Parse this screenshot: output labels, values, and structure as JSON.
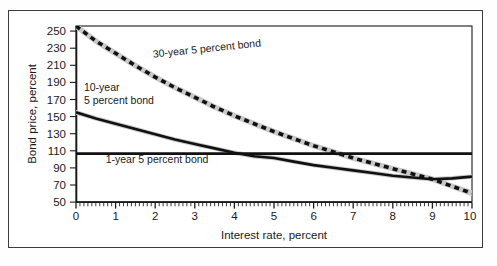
{
  "chart_data": {
    "type": "line",
    "title": "",
    "xlabel": "Interest rate, percent",
    "ylabel": "Bond price, percent",
    "xlim": [
      0,
      10
    ],
    "ylim": [
      50,
      250
    ],
    "xticks": [
      "0",
      "1",
      "2",
      "3",
      "4",
      "5",
      "6",
      "7",
      "8",
      "9",
      "10"
    ],
    "yticks": [
      "50",
      "70",
      "90",
      "110",
      "130",
      "150",
      "170",
      "190",
      "210",
      "230",
      "250"
    ],
    "grid": false,
    "legend_position": "inline-annotations",
    "x": [
      0,
      0.5,
      1,
      1.5,
      2,
      2.5,
      3,
      3.5,
      4,
      4.5,
      5,
      5.5,
      6,
      6.5,
      7,
      7.5,
      8,
      8.5,
      9,
      9.5,
      10
    ],
    "series": [
      {
        "name": "30-year 5 percent bond",
        "style": "dashed",
        "color": "#111111",
        "values": [
          250,
          236,
          223,
          211,
          200,
          189,
          179,
          170,
          162,
          154,
          147,
          140,
          134,
          128,
          122,
          117,
          112,
          107,
          103,
          99,
          95
        ],
        "values_pixel_read": [
          250,
          233,
          219,
          205,
          192,
          180,
          169,
          158,
          148,
          139,
          130,
          122,
          114,
          107,
          100,
          94,
          88,
          82,
          76,
          68,
          60
        ]
      },
      {
        "name": "10-year 5 percent bond",
        "style": "solid",
        "color": "#111111",
        "values": [
          152,
          145,
          139,
          133,
          127,
          121,
          116,
          111,
          106,
          102,
          100,
          96,
          92,
          89,
          86,
          83,
          80,
          78,
          76,
          77,
          79
        ]
      },
      {
        "name": "1-year 5 percent bond",
        "style": "solid",
        "color": "#111111",
        "values": [
          105,
          105,
          105,
          105,
          105,
          105,
          105,
          105,
          105,
          105,
          105,
          105,
          105,
          105,
          105,
          105,
          105,
          105,
          105,
          105,
          105
        ]
      }
    ],
    "annotations": [
      {
        "id": "ann-30yr",
        "text": "30-year 5 percent bond",
        "x": 1.95,
        "y": 214,
        "rotate": -6
      },
      {
        "id": "ann-10yr-line1",
        "text": "10-year",
        "x": 0.2,
        "y": 176,
        "rotate": 0
      },
      {
        "id": "ann-10yr-line2",
        "text": "5 percent bond",
        "x": 0.2,
        "y": 161,
        "rotate": 0
      },
      {
        "id": "ann-1yr",
        "text": "1-year 5 percent bond",
        "x": 0.75,
        "y": 94,
        "rotate": 0
      }
    ],
    "colors": {
      "line": "#111111",
      "halo": "#c9c9c9",
      "axis": "#1a1a1a",
      "frame": "#3c3c3c",
      "background": "#ffffff"
    }
  }
}
